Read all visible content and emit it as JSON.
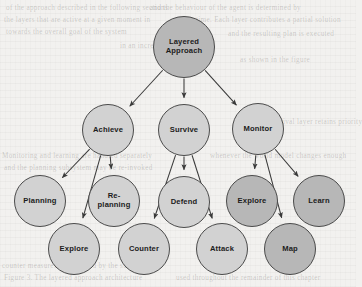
{
  "diagram": {
    "title": "Layered Approach",
    "type": "tree-hierarchy",
    "canvas": {
      "width": 356,
      "height": 287
    },
    "style": {
      "background": "#f2f1ef",
      "node_fill_light": "#d2d2d2",
      "node_fill_dark": "#b7b7b7",
      "node_stroke": "#4b4b4b",
      "edge_color": "#3a3a3a",
      "label_color": "#1c1c1c"
    },
    "nodes": [
      {
        "id": "layered-approach",
        "label": "Layered\nApproach",
        "level": 0,
        "cx": 184,
        "cy": 47,
        "r": 31,
        "shade": "dark"
      },
      {
        "id": "achieve",
        "label": "Achieve",
        "level": 1,
        "cx": 108,
        "cy": 130,
        "r": 26,
        "shade": "light"
      },
      {
        "id": "survive",
        "label": "Survive",
        "level": 1,
        "cx": 184,
        "cy": 130,
        "r": 26,
        "shade": "light"
      },
      {
        "id": "monitor",
        "label": "Monitor",
        "level": 1,
        "cx": 258,
        "cy": 129,
        "r": 26,
        "shade": "light"
      },
      {
        "id": "planning",
        "label": "Planning",
        "level": 2,
        "cx": 40,
        "cy": 201,
        "r": 26,
        "shade": "light"
      },
      {
        "id": "re-planning",
        "label": "Re-\nplanning",
        "level": 2,
        "cx": 114,
        "cy": 201,
        "r": 26,
        "shade": "light"
      },
      {
        "id": "defend",
        "label": "Defend",
        "level": 2,
        "cx": 184,
        "cy": 202,
        "r": 26,
        "shade": "light"
      },
      {
        "id": "explore-monitor",
        "label": "Explore",
        "level": 2,
        "cx": 252,
        "cy": 201,
        "r": 26,
        "shade": "dark"
      },
      {
        "id": "learn",
        "label": "Learn",
        "level": 2,
        "cx": 319,
        "cy": 201,
        "r": 26,
        "shade": "dark"
      },
      {
        "id": "explore-achieve",
        "label": "Explore",
        "level": 3,
        "cx": 74,
        "cy": 249,
        "r": 26,
        "shade": "light"
      },
      {
        "id": "counter",
        "label": "Counter",
        "level": 3,
        "cx": 144,
        "cy": 249,
        "r": 26,
        "shade": "light"
      },
      {
        "id": "attack",
        "label": "Attack",
        "level": 3,
        "cx": 222,
        "cy": 249,
        "r": 26,
        "shade": "light"
      },
      {
        "id": "map",
        "label": "Map",
        "level": 3,
        "cx": 290,
        "cy": 249,
        "r": 26,
        "shade": "dark"
      }
    ],
    "edges": [
      {
        "from": "layered-approach",
        "to": "achieve"
      },
      {
        "from": "layered-approach",
        "to": "survive"
      },
      {
        "from": "layered-approach",
        "to": "monitor"
      },
      {
        "from": "achieve",
        "to": "planning"
      },
      {
        "from": "achieve",
        "to": "re-planning"
      },
      {
        "from": "achieve",
        "to": "explore-achieve"
      },
      {
        "from": "survive",
        "to": "counter"
      },
      {
        "from": "survive",
        "to": "defend"
      },
      {
        "from": "survive",
        "to": "attack"
      },
      {
        "from": "monitor",
        "to": "explore-monitor"
      },
      {
        "from": "monitor",
        "to": "map"
      },
      {
        "from": "monitor",
        "to": "learn"
      }
    ],
    "background_text": [
      {
        "text": "of the approach described in the following sections",
        "x": 6,
        "y": 4
      },
      {
        "text": "and the behaviour of the agent is determined by",
        "x": 150,
        "y": 4
      },
      {
        "text": "the layers that are active at a given moment in",
        "x": 4,
        "y": 16
      },
      {
        "text": "time. Each layer contributes a partial solution",
        "x": 196,
        "y": 16
      },
      {
        "text": "towards the overall goal of the system",
        "x": 6,
        "y": 28
      },
      {
        "text": "and the resulting plan is executed",
        "x": 228,
        "y": 30
      },
      {
        "text": "in an incremental fashion",
        "x": 120,
        "y": 42
      },
      {
        "text": "as shown in the figure",
        "x": 240,
        "y": 56
      },
      {
        "text": "Monitoring and learning are handled separately",
        "x": 2,
        "y": 152
      },
      {
        "text": "while the survival layer retains priority",
        "x": 238,
        "y": 118
      },
      {
        "text": "and the planning subsystem may be re-invoked",
        "x": 4,
        "y": 164
      },
      {
        "text": "whenever the world model changes enough",
        "x": 210,
        "y": 152
      },
      {
        "text": "Figure 3. The layered approach architecture",
        "x": 4,
        "y": 274
      },
      {
        "text": "used throughout the remainder of this chapter",
        "x": 176,
        "y": 274
      },
      {
        "text": "counter measures are selected by the survive",
        "x": 2,
        "y": 262
      }
    ]
  }
}
